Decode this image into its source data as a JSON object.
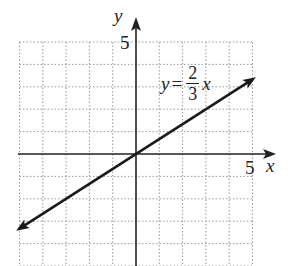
{
  "chart_data": {
    "type": "line",
    "title": "",
    "xlabel": "x",
    "ylabel": "y",
    "xlim": [
      -5,
      5
    ],
    "ylim": [
      -5,
      5
    ],
    "grid": true,
    "grid_style": "dotted",
    "x_ticks_labeled": [
      5
    ],
    "y_ticks_labeled": [
      5
    ],
    "series": [
      {
        "name": "y = (2/3)x",
        "equation": "y = 2/3 x",
        "slope": 0.6667,
        "intercept": 0,
        "x": [
          -5,
          0,
          5
        ],
        "y": [
          -3.33,
          0,
          3.33
        ],
        "arrows": "both"
      }
    ],
    "annotations": [
      {
        "text": "y = 2/3 x",
        "x": 2.5,
        "y": 3.2
      }
    ]
  },
  "labels": {
    "y_axis": "y",
    "x_axis": "x",
    "y_tick": "5",
    "x_tick": "5",
    "eq_lhs": "y",
    "eq_sign": "=",
    "eq_num": "2",
    "eq_den": "3",
    "eq_rhs": "x"
  },
  "colors": {
    "axis": "#222222",
    "grid": "#9a9a9a",
    "line": "#1a1a1a",
    "background": "#ffffff"
  }
}
